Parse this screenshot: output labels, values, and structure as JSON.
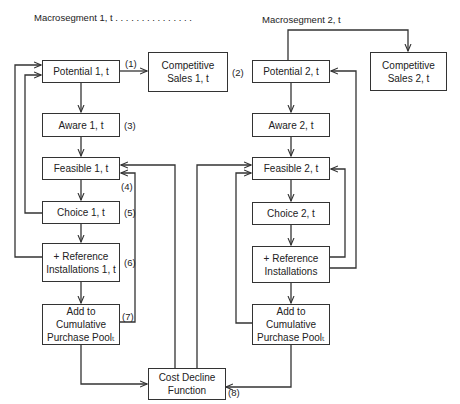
{
  "headers": {
    "macro1": "Macrosegment 1, t . . . . . . . . . . . . . . .",
    "macro2": "Macrosegment 2, t"
  },
  "left_column": {
    "potential": "Potential 1, t",
    "competitive_sales": "Competitive\nSales 1, t",
    "aware": "Aware 1, t",
    "feasible": "Feasible 1, t",
    "choice": "Choice 1, t",
    "reference": "+ Reference\nInstallations 1, t",
    "cumulative": "Add to Cumulative\nPurchase Poolₜ"
  },
  "right_column": {
    "potential": "Potential 2, t",
    "competitive_sales": "Competitive\nSales 2, t",
    "aware": "Aware 2, t",
    "feasible": "Feasible 2, t",
    "choice": "Choice 2, t",
    "reference": "+ Reference\nInstallations",
    "cumulative": "Add to Cumulative\nPurchase Poolₜ"
  },
  "cost_decline": "Cost Decline\nFunction",
  "step_labels": {
    "s1": "(1)",
    "s2": "(2)",
    "s3": "(3)",
    "s4": "(4)",
    "s5": "(5)",
    "s6": "(6)",
    "s7": "(7)",
    "s8": "(8)"
  },
  "colors": {
    "line": "#333333",
    "text": "#222222",
    "background": "#ffffff"
  }
}
